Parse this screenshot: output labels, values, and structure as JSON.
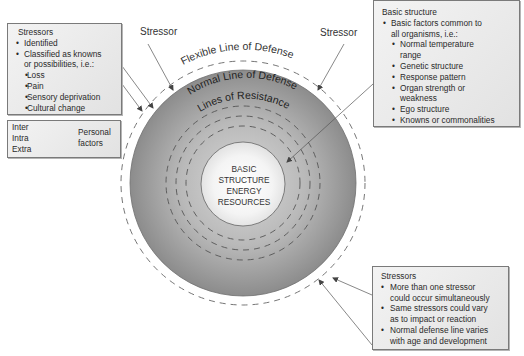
{
  "diagram": {
    "core": {
      "lines": [
        "BASIC",
        "STRUCTURE",
        "ENERGY",
        "RESOURCES"
      ]
    },
    "rings": {
      "flexible": "Flexible Line of Defense",
      "normal": "Normal Line of Defense",
      "resistance": "Lines of Resistance"
    },
    "stressor_labels": [
      "Stressor",
      "Stressor"
    ],
    "colors": {
      "outer_ring": "#8f8f8f",
      "core_fill": "#f7f7f7",
      "box_fill": "#e8e8e8",
      "box_border": "#7a7a7a",
      "arrow": "#555555"
    }
  },
  "boxes": {
    "left_stressors": {
      "title": "Stressors",
      "items": [
        {
          "text": "Identified",
          "level": 1
        },
        {
          "text": "Classified as knowns",
          "level": 1
        },
        {
          "text": "or possibilities, i.e.:",
          "level": "cont"
        },
        {
          "text": "Loss",
          "level": 2
        },
        {
          "text": "Pain",
          "level": 2
        },
        {
          "text": "Sensory deprivation",
          "level": 2
        },
        {
          "text": "Cultural change",
          "level": 2
        }
      ]
    },
    "personal_factors": {
      "items": [
        "Inter",
        "Intra",
        "Extra"
      ],
      "label_line1": "Personal",
      "label_line2": "factors"
    },
    "basic_structure": {
      "title": "Basic structure",
      "items": [
        {
          "text": "Basic factors common to",
          "level": 1
        },
        {
          "text": "all organisms, i.e.:",
          "level": "cont"
        },
        {
          "text": "Normal temperature",
          "level": 2
        },
        {
          "text": "range",
          "level": "subcont"
        },
        {
          "text": "Genetic structure",
          "level": 2
        },
        {
          "text": "Response pattern",
          "level": 2
        },
        {
          "text": "Organ strength or",
          "level": 2
        },
        {
          "text": "weakness",
          "level": "subcont"
        },
        {
          "text": "Ego structure",
          "level": 2
        },
        {
          "text": "Knowns or commonalities",
          "level": 2
        }
      ]
    },
    "bottom_stressors": {
      "title": "Stressors",
      "items": [
        {
          "text": "More than one stressor",
          "level": 1
        },
        {
          "text": "could occur simultaneously",
          "level": "cont"
        },
        {
          "text": "Same stressors could vary",
          "level": 1
        },
        {
          "text": "as to impact or reaction",
          "level": "cont"
        },
        {
          "text": "Normal defense line varies",
          "level": 1
        },
        {
          "text": "with age and development",
          "level": "cont"
        }
      ]
    }
  }
}
